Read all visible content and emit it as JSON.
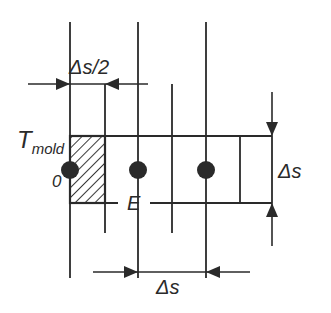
{
  "diagram": {
    "title": "",
    "labels": {
      "half_step": "Δs/2",
      "temperature_main": "T",
      "temperature_sub": "mold",
      "origin": "0",
      "node_e": "E",
      "step_vertical": "Δs",
      "step_horizontal": "Δs"
    },
    "nodes": [
      {
        "id": "node-0",
        "x": 70,
        "y": 170
      },
      {
        "id": "node-e",
        "x": 138,
        "y": 170
      },
      {
        "id": "node-2",
        "x": 206,
        "y": 170
      }
    ],
    "colors": {
      "line": "#2a2a2a",
      "background": "#ffffff",
      "hatch": "#3a3a3a"
    }
  }
}
